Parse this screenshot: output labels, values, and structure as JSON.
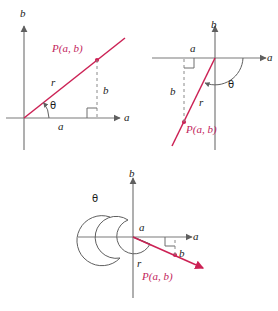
{
  "figure": {
    "colors": {
      "ray": "#cc2255",
      "label_red": "#c2245c",
      "axis": "#7a7a7a",
      "dashed": "#8a8a8a",
      "text": "#1a1a1a",
      "background": "#ffffff"
    },
    "panels": [
      {
        "id": "panel-acute",
        "name": "acute-angle-diagram",
        "labels": {
          "axis_vertical": "b",
          "axis_horizontal": "a",
          "point": "P(a, b)",
          "radius": "r",
          "angle": "θ",
          "leg_horizontal": "a",
          "leg_vertical": "b"
        }
      },
      {
        "id": "panel-obtuse",
        "name": "reflex-downward-angle-diagram",
        "labels": {
          "axis_vertical": "b",
          "axis_horizontal": "a",
          "point": "P(a, b)",
          "radius": "r",
          "angle": "θ",
          "leg_horizontal": "a",
          "leg_vertical": "b"
        }
      },
      {
        "id": "panel-spiral",
        "name": "multi-revolution-angle-diagram",
        "labels": {
          "axis_vertical": "b",
          "axis_horizontal": "a",
          "point": "P(a, b)",
          "radius": "r",
          "angle": "θ",
          "leg_horizontal": "a",
          "leg_vertical": "b"
        }
      }
    ]
  }
}
